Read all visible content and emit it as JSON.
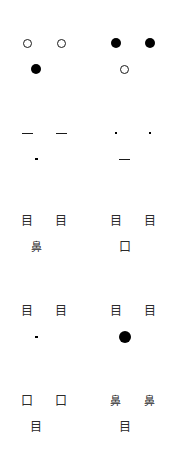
{
  "canvas": {
    "width": 177,
    "height": 472,
    "background": "#ffffff",
    "ink": "#000000",
    "ink_soft": "#2b2b2b"
  },
  "glyph_names": {
    "circle_hollow": "hollow-circle-glyph",
    "circle_filled": "filled-circle-glyph",
    "dot": "dot-glyph",
    "dash": "dash-glyph",
    "eye_char": "kanji-eye-glyph",
    "nose_char": "kanji-nose-glyph",
    "mouth_char": "kanji-mouth-glyph"
  },
  "glyph_text": {
    "eye_char": "目",
    "nose_char": "鼻",
    "mouth_char": "口"
  },
  "rows": [
    {
      "index": 1,
      "top": 30,
      "left_panel": {
        "eyes": [
          "circle_hollow",
          "circle_hollow"
        ],
        "mouth": "circle_filled",
        "mouth_shift": "left"
      },
      "right_panel": {
        "eyes": [
          "circle_filled",
          "circle_filled"
        ],
        "mouth": "circle_hollow",
        "mouth_shift": "left"
      }
    },
    {
      "index": 2,
      "top": 120,
      "left_panel": {
        "eyes": [
          "dash",
          "dash"
        ],
        "mouth": "dot",
        "mouth_shift": "left"
      },
      "right_panel": {
        "eyes": [
          "dot",
          "dot"
        ],
        "mouth": "dash",
        "mouth_shift": "left"
      }
    },
    {
      "index": 3,
      "top": 208,
      "left_panel": {
        "eyes": [
          "eye_char",
          "eye_char"
        ],
        "mouth": "nose_char",
        "mouth_shift": "left"
      },
      "right_panel": {
        "eyes": [
          "eye_char",
          "eye_char"
        ],
        "mouth": "mouth_char",
        "mouth_shift": "left"
      }
    },
    {
      "index": 4,
      "top": 298,
      "left_panel": {
        "eyes": [
          "eye_char",
          "eye_char"
        ],
        "mouth": "dot",
        "mouth_shift": "left"
      },
      "right_panel": {
        "eyes": [
          "eye_char",
          "eye_char"
        ],
        "mouth": "circle_filled_big",
        "mouth_shift": "left"
      }
    },
    {
      "index": 5,
      "top": 388,
      "left_panel": {
        "eyes": [
          "mouth_char",
          "mouth_char"
        ],
        "mouth": "eye_char",
        "mouth_shift": "left"
      },
      "right_panel": {
        "eyes": [
          "nose_char",
          "nose_char"
        ],
        "mouth": "eye_char",
        "mouth_shift": "left"
      }
    }
  ]
}
